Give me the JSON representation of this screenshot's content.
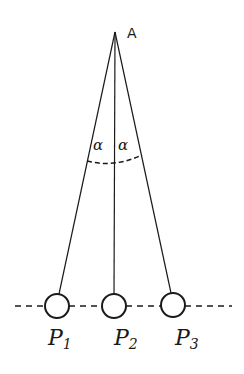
{
  "diagram": {
    "apex": {
      "label": "A",
      "x": 115,
      "y": 32
    },
    "angle_label": "α",
    "angle_label_left": "α",
    "angle_label_right": "α",
    "balls": [
      {
        "label": "P",
        "sub": "1",
        "cx": 57,
        "cy": 306,
        "r": 12
      },
      {
        "label": "P",
        "sub": "2",
        "cx": 114,
        "cy": 306,
        "r": 12
      },
      {
        "label": "P",
        "sub": "3",
        "cx": 173,
        "cy": 305,
        "r": 12
      }
    ],
    "stroke_color": "#1a1a1a",
    "background": "#ffffff"
  }
}
